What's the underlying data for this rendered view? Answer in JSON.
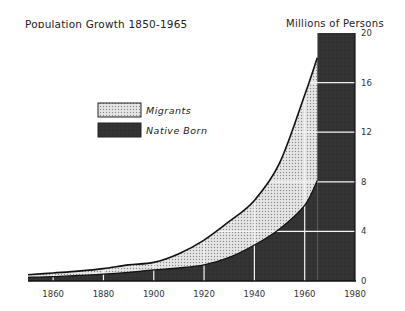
{
  "chart_data": {
    "type": "area",
    "title": "Population Growth 1850-1965",
    "ylabel": "Millions of Persons",
    "xlabel": "",
    "x": [
      1850,
      1860,
      1870,
      1880,
      1890,
      1900,
      1910,
      1920,
      1930,
      1940,
      1950,
      1960,
      1965
    ],
    "series": [
      {
        "name": "Native Born",
        "values": [
          0.3,
          0.35,
          0.45,
          0.55,
          0.7,
          0.9,
          1.05,
          1.3,
          1.9,
          2.9,
          4.2,
          6.1,
          8.1
        ]
      },
      {
        "name": "Migrants",
        "values": [
          0.2,
          0.3,
          0.35,
          0.45,
          0.6,
          0.6,
          1.15,
          2.0,
          2.9,
          3.6,
          5.3,
          8.9,
          9.9
        ]
      }
    ],
    "totals": [
      0.5,
      0.65,
      0.8,
      1.0,
      1.3,
      1.5,
      2.2,
      3.3,
      4.8,
      6.5,
      9.5,
      15.0,
      18.0
    ],
    "xticks": [
      "1860",
      "1880",
      "1900",
      "1920",
      "1940",
      "1960",
      "1980"
    ],
    "yticks": [
      "0",
      "4",
      "8",
      "12",
      "16",
      "20"
    ],
    "xlim": [
      1850,
      1980
    ],
    "ylim": [
      0,
      20
    ],
    "grid": true,
    "legend_position": "upper-left-center",
    "annotations": [
      "Shaded dark band 1965-1980 spanning full height"
    ]
  },
  "title": "Population Growth 1850-1965",
  "ylabel": "Millions of Persons",
  "legend": {
    "migrants": "Migrants",
    "native": "Native Born"
  },
  "colors": {
    "native": "#2f2f2f",
    "migrants": "#d9d9d9",
    "grid": "#f0f0f0"
  }
}
